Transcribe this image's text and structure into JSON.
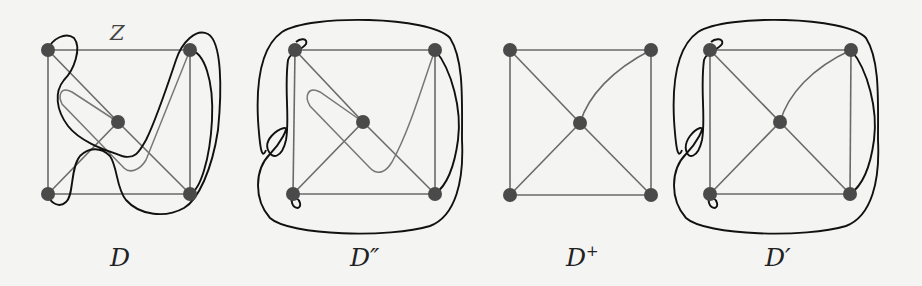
{
  "figure": {
    "panels": [
      {
        "id": "D",
        "label": "D",
        "label_base": "D",
        "label_mark": "",
        "edge_label": "Z",
        "description": "Drawing D with crossing closed curves around vertices"
      },
      {
        "id": "D2",
        "label": "D″",
        "label_base": "D",
        "label_mark": "″",
        "description": "Drawing D'' with enclosing curve"
      },
      {
        "id": "Dplus",
        "label": "D+",
        "label_base": "D",
        "label_mark": "+",
        "description": "Drawing D+ (plain graph)"
      },
      {
        "id": "D1",
        "label": "D′",
        "label_base": "D",
        "label_mark": "′",
        "description": "Drawing D' with enclosing curve"
      }
    ],
    "graph": {
      "vertices": [
        "top-left",
        "top-right",
        "bottom-left",
        "bottom-right",
        "center"
      ],
      "edges": [
        [
          "top-left",
          "top-right"
        ],
        [
          "top-left",
          "bottom-left"
        ],
        [
          "top-right",
          "bottom-right"
        ],
        [
          "bottom-left",
          "bottom-right"
        ],
        [
          "top-left",
          "center"
        ],
        [
          "center",
          "bottom-right"
        ],
        [
          "bottom-left",
          "center"
        ],
        [
          "center",
          "top-right"
        ]
      ]
    }
  }
}
